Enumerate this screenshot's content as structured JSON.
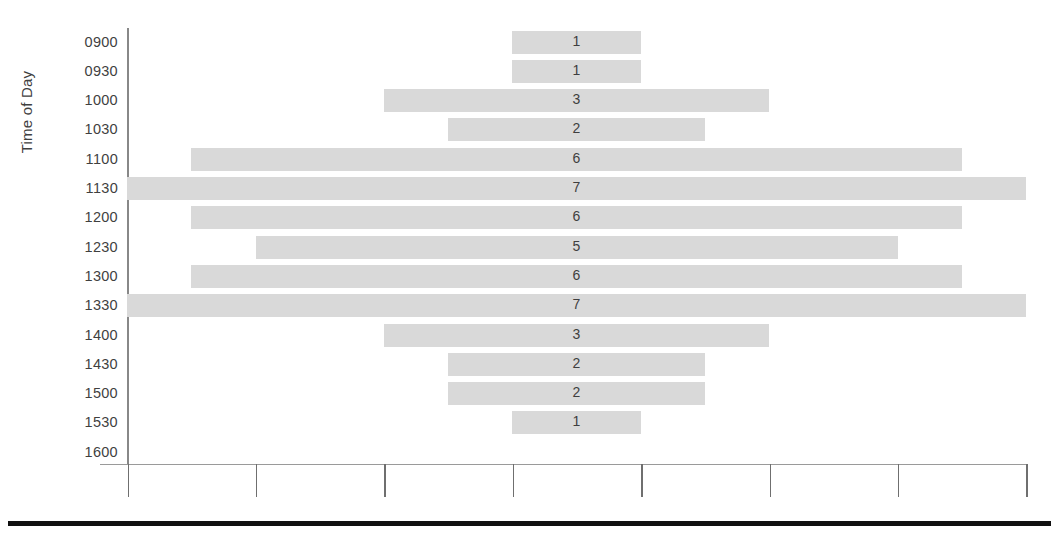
{
  "chart_data": {
    "type": "bar",
    "orientation": "horizontal",
    "title": "",
    "xlabel": "",
    "ylabel": "Time of Day",
    "grid": false,
    "legend": null,
    "bars_centered": true,
    "x_axis": {
      "tick_labels": [
        "",
        "",
        "",
        "",
        "",
        "",
        "",
        ""
      ],
      "tick_count": 8,
      "units_per_tick": 1,
      "range_hint": "unlabeled ticks, 1 unit spacing"
    },
    "categories": [
      "0900",
      "0930",
      "1000",
      "1030",
      "1100",
      "1130",
      "1200",
      "1230",
      "1300",
      "1330",
      "1400",
      "1430",
      "1500",
      "1530",
      "1600"
    ],
    "values": [
      1,
      1,
      3,
      2,
      6,
      7,
      6,
      5,
      6,
      7,
      3,
      2,
      2,
      1,
      0
    ],
    "value_labels": [
      "1",
      "1",
      "3",
      "2",
      "6",
      "7",
      "6",
      "5",
      "6",
      "7",
      "3",
      "2",
      "2",
      "1",
      ""
    ],
    "colors": {
      "bar_fill": "#d9d9d9",
      "label_text": "#3f3f3f",
      "axis_line": "#888888",
      "bottom_rule": "#111111",
      "background": "#ffffff"
    }
  },
  "axis": {
    "y_title": "Time of Day"
  }
}
